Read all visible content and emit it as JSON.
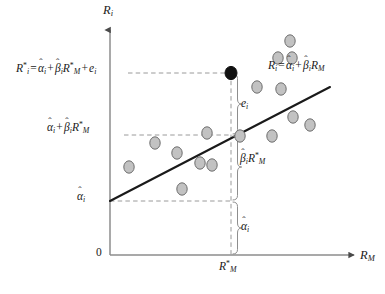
{
  "figure": {
    "background_color": "#ffffff",
    "axis_color": "#8c8c8c",
    "line_color": "#1a1a1a",
    "guide_color": "#9a9a9a",
    "marker_fill": "#c2c2c2",
    "marker_stroke": "#6e6e6e",
    "highlight_fill": "#111111"
  },
  "axes": {
    "y_label": "R_i",
    "x_label": "R_M",
    "origin_label": "0",
    "x_tick_label": "R*_M"
  },
  "labels": {
    "observed_return": "R*_i = α̂_i + β̂_i R*_M + e_i",
    "fitted_return": "α̂_i + β̂_i R*_M",
    "intercept_axis": "α̂_i",
    "line_equation": "R_i = α̂_i + β̂_i R_M",
    "residual": "e_i",
    "systematic": "β̂_i R*_M",
    "intercept_brace": "α̂_i"
  },
  "chart_data": {
    "type": "scatter",
    "title": "",
    "xlabel": "R_M",
    "ylabel": "R_i",
    "grid": false,
    "legend": "none",
    "xlim": [
      0,
      100
    ],
    "ylim": [
      0,
      100
    ],
    "axis_pixels": {
      "x_origin": 110,
      "y_origin": 255,
      "x_end": 352,
      "y_end": 32
    },
    "regression_line": {
      "label": "R_i = α̂_i + β̂_i R_M",
      "p1": [
        110,
        201
      ],
      "p2": [
        330,
        87
      ]
    },
    "highlight_point": {
      "label": "R*_i",
      "cx": 231,
      "cy": 73,
      "rx": 6.0,
      "ry": 6.6
    },
    "guides": {
      "h_observed_y": 73,
      "h_fitted_y": 135,
      "h_intercept_y": 201,
      "v_rm_star_x": 231,
      "h_left_x": 110,
      "h_label_left_x": 128
    },
    "braces": [
      {
        "name": "residual",
        "label": "e_i",
        "y_top": 73,
        "y_bottom": 135
      },
      {
        "name": "systematic",
        "label": "β̂_i R*_M",
        "y_top": 135,
        "y_bottom": 201
      },
      {
        "name": "intercept",
        "label": "α̂_i",
        "y_top": 201,
        "y_bottom": 255
      }
    ],
    "points": [
      {
        "cx": 129,
        "cy": 167
      },
      {
        "cx": 155,
        "cy": 143
      },
      {
        "cx": 177,
        "cy": 153
      },
      {
        "cx": 182,
        "cy": 189
      },
      {
        "cx": 200,
        "cy": 163
      },
      {
        "cx": 212,
        "cy": 165
      },
      {
        "cx": 207,
        "cy": 133
      },
      {
        "cx": 240,
        "cy": 136
      },
      {
        "cx": 257,
        "cy": 87
      },
      {
        "cx": 272,
        "cy": 136
      },
      {
        "cx": 278,
        "cy": 58
      },
      {
        "cx": 281,
        "cy": 89
      },
      {
        "cx": 292,
        "cy": 58
      },
      {
        "cx": 293,
        "cy": 117
      },
      {
        "cx": 310,
        "cy": 125
      },
      {
        "cx": 290,
        "cy": 41
      }
    ]
  }
}
